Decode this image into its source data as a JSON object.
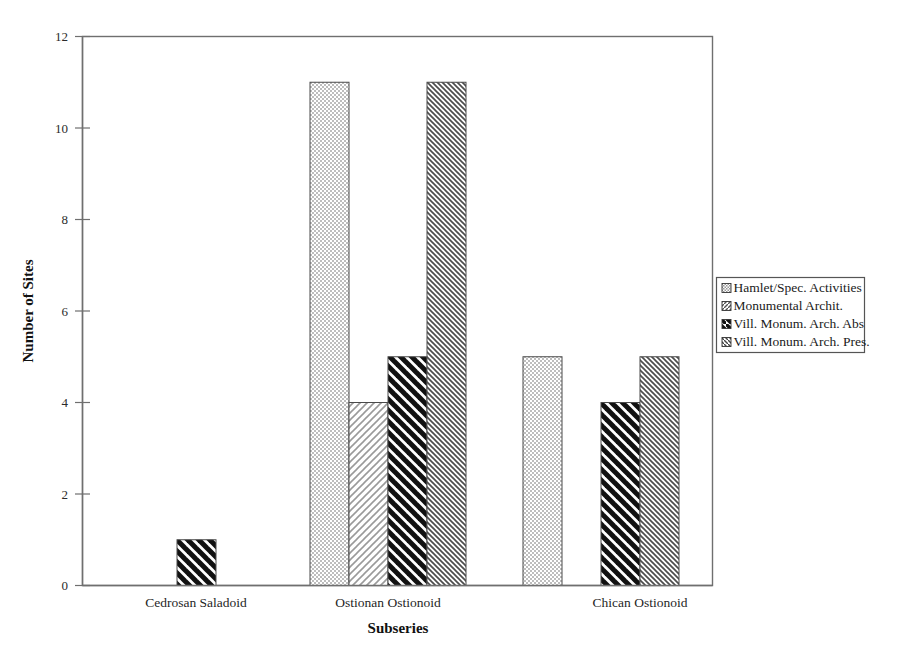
{
  "chart_data": {
    "type": "bar",
    "title": "",
    "xlabel": "Subseries",
    "ylabel": "Number of Sites",
    "categories": [
      "Cedrosan Saladoid",
      "Ostionan Ostionoid",
      "Chican Ostionoid"
    ],
    "ylim": [
      0,
      12
    ],
    "ytick_labels": [
      "0",
      "2",
      "4",
      "6",
      "8",
      "10",
      "12"
    ],
    "ytick_values": [
      0,
      2,
      4,
      6,
      8,
      10,
      12
    ],
    "grid": false,
    "legend_position": "right",
    "series": [
      {
        "name": "Hamlet/Spec. Activities",
        "pattern": "fine-dotted",
        "values": [
          0,
          11,
          5
        ]
      },
      {
        "name": "Monumental Archit.",
        "pattern": "fine-forward-slash",
        "values": [
          0,
          4,
          0
        ]
      },
      {
        "name": "Vill. Monum. Arch. Abs",
        "pattern": "thick-back-slash",
        "values": [
          1,
          5,
          4
        ]
      },
      {
        "name": "Vill. Monum. Arch. Pres.",
        "pattern": "fine-back-slash",
        "values": [
          0,
          11,
          5
        ]
      }
    ]
  },
  "axes": {
    "ylabel": "Number of Sites",
    "xlabel": "Subseries",
    "yticks": [
      "0",
      "2",
      "4",
      "6",
      "8",
      "10",
      "12"
    ],
    "categories": [
      "Cedrosan Saladoid",
      "Ostionan Ostionoid",
      "Chican Ostionoid"
    ]
  },
  "legend": {
    "entries": [
      "Hamlet/Spec. Activities",
      "Monumental Archit.",
      "Vill. Monum. Arch. Abs",
      "Vill. Monum. Arch. Pres."
    ]
  },
  "colors": {
    "background": "#ffffff",
    "ink": "#1a1a1a",
    "frame": "#6f6f6f",
    "bar_stroke": "#4a4a4a",
    "pattern_light": "#d9d9d9",
    "pattern_dark": "#1a1a1a"
  }
}
